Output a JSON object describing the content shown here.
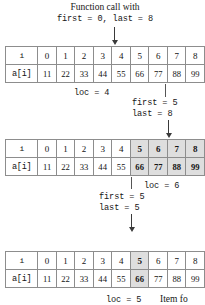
{
  "figure": {
    "title_line1": "Function call with",
    "title_line2": "first = 0, last = 8"
  },
  "steps": [
    {
      "id": "step-1",
      "call_label_line1": "Function call with",
      "call_label_line2": "first = 0, last = 8",
      "pointer_index": 4,
      "loc_label": "loc = 4",
      "row_header_index": "i",
      "row_header_values": "a[i]",
      "indices": [
        "0",
        "1",
        "2",
        "3",
        "4",
        "5",
        "6",
        "7",
        "8"
      ],
      "values": [
        "11",
        "22",
        "33",
        "44",
        "55",
        "66",
        "77",
        "88",
        "99"
      ],
      "highlight": []
    },
    {
      "id": "step-2",
      "call_label_line1": "first = 5",
      "call_label_line2": "last = 8",
      "pointer_index": 7,
      "loc_label": "loc = 6",
      "row_header_index": "i",
      "row_header_values": "a[i]",
      "indices": [
        "0",
        "1",
        "2",
        "3",
        "4",
        "5",
        "6",
        "7",
        "8"
      ],
      "values": [
        "11",
        "22",
        "33",
        "44",
        "55",
        "66",
        "77",
        "88",
        "99"
      ],
      "highlight": [
        5,
        6,
        7,
        8
      ]
    },
    {
      "id": "step-3",
      "call_label_line1": "first = 5",
      "call_label_line2": "last = 5",
      "pointer_index": 5,
      "loc_label": "loc = 5",
      "trailing_label": "Item fo",
      "row_header_index": "i",
      "row_header_values": "a[i]",
      "indices": [
        "0",
        "1",
        "2",
        "3",
        "4",
        "5",
        "6",
        "7",
        "8"
      ],
      "values": [
        "11",
        "22",
        "33",
        "44",
        "55",
        "66",
        "77",
        "88",
        "99"
      ],
      "highlight": [
        5
      ]
    }
  ],
  "colors": {
    "highlight_fill": "#dedede",
    "border": "#4a4a4a",
    "cell_border": "#8d8d8d",
    "text": "#141414",
    "arrow": "#3a3a3a"
  }
}
